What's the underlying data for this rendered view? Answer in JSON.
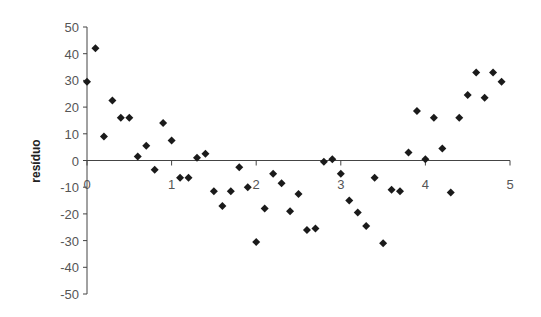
{
  "chart_data": {
    "type": "scatter",
    "title": "",
    "xlabel": "",
    "ylabel": "resíduo",
    "xlim": [
      0,
      5
    ],
    "ylim": [
      -50,
      50
    ],
    "x_ticks": [
      0,
      1,
      2,
      3,
      4,
      5
    ],
    "y_ticks": [
      50,
      40,
      30,
      20,
      10,
      0,
      -10,
      -20,
      -30,
      -40,
      -50
    ],
    "grid": false,
    "legend": null,
    "marker": "diamond",
    "marker_color": "#1a1a1a",
    "series": [
      {
        "name": "resíduo",
        "x": [
          0.0,
          0.1,
          0.2,
          0.3,
          0.4,
          0.5,
          0.6,
          0.7,
          0.8,
          0.9,
          1.0,
          1.1,
          1.2,
          1.3,
          1.4,
          1.5,
          1.6,
          1.7,
          1.8,
          1.9,
          2.0,
          2.1,
          2.2,
          2.3,
          2.4,
          2.5,
          2.6,
          2.7,
          2.8,
          2.9,
          3.0,
          3.1,
          3.2,
          3.3,
          3.4,
          3.5,
          3.6,
          3.7,
          3.8,
          3.9,
          4.0,
          4.1,
          4.2,
          4.3,
          4.4,
          4.5,
          4.6,
          4.7,
          4.8,
          4.9
        ],
        "y": [
          29.5,
          42,
          9,
          22.5,
          16,
          16,
          1.5,
          5.5,
          -3.5,
          14,
          7.5,
          -6.5,
          -6.5,
          1,
          2.5,
          -11.5,
          -17,
          -11.5,
          -2.5,
          -10,
          -30.5,
          -18,
          -5,
          -8.5,
          -19,
          -12.5,
          -26,
          -25.5,
          -0.5,
          0.5,
          -5,
          -15,
          -19.5,
          -24.5,
          -6.5,
          -31,
          -11,
          -11.5,
          3,
          18.5,
          0.5,
          16,
          4.5,
          -12,
          16,
          24.5,
          33,
          23.5,
          33,
          29.5
        ]
      }
    ]
  }
}
